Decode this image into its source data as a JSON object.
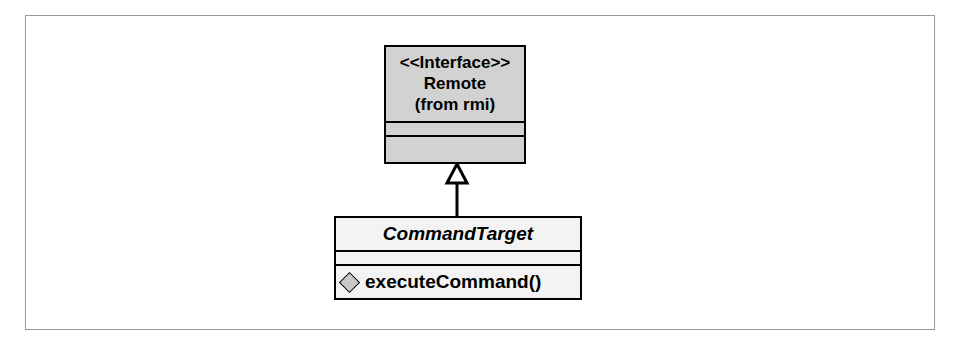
{
  "diagram": {
    "type": "uml-class-diagram",
    "frame": {
      "border_color": "#9a9a9a",
      "background": "#ffffff"
    },
    "classes": [
      {
        "id": "remote",
        "stereotype": "<<Interface>>",
        "name": "Remote",
        "package": "(from rmi)",
        "fill_color": "#d2d2d2",
        "border_color": "#000000",
        "attributes": [],
        "operations": []
      },
      {
        "id": "commandtarget",
        "name": "CommandTarget",
        "fill_color": "#f3f3f3",
        "border_color": "#000000",
        "abstract": true,
        "attributes": [],
        "operations": [
          {
            "visibility": "public-diamond-icon",
            "signature": "executeCommand()"
          }
        ]
      }
    ],
    "relationships": [
      {
        "kind": "generalization",
        "source": "commandtarget",
        "target": "remote",
        "arrow": "hollow-triangle",
        "line_color": "#000000"
      }
    ]
  }
}
